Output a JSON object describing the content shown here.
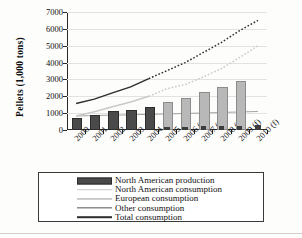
{
  "chart_data": {
    "type": "bar",
    "title": "",
    "xlabel": "",
    "ylabel": "Pellets (1,000 tons)",
    "ylim": [
      0,
      7000
    ],
    "yticks": [
      0,
      1000,
      2000,
      3000,
      4000,
      5000,
      6000,
      7000
    ],
    "ytick_labels": [
      "0",
      "1000",
      "2000",
      "3000",
      "4000",
      "5000",
      "6000",
      "7000"
    ],
    "grid": true,
    "legend_position": "below-plot",
    "categories": [
      "2000",
      "2001",
      "2002",
      "2003",
      "2004",
      "2005",
      "2006 (f)",
      "2007 (f)",
      "2008 (f)",
      "2009 (f)",
      "2010 (f)"
    ],
    "series": [
      {
        "name": "North American production",
        "kind": "bar",
        "color": "#4a4a4a",
        "values": [
          620,
          750,
          1000,
          1080,
          1270,
          1420,
          null,
          null,
          null,
          null,
          null
        ]
      },
      {
        "name": "North American consumption",
        "kind": "bar",
        "color": "#b8b8b8",
        "values": [
          null,
          null,
          null,
          null,
          null,
          1570,
          1760,
          2140,
          2460,
          2760,
          null
        ]
      },
      {
        "name": "European consumption",
        "kind": "line",
        "color": "#9a9a9a",
        "values": [
          830,
          860,
          880,
          900,
          930,
          950,
          980,
          1010,
          1040,
          1070,
          1100
        ]
      },
      {
        "name": "Other consumption",
        "kind": "bar",
        "color": "#3d3d3d",
        "values": [
          null,
          null,
          null,
          null,
          null,
          170,
          200,
          220,
          240,
          260,
          280
        ]
      },
      {
        "name": "Total consumption",
        "kind": "line",
        "color": "#2e2e2e",
        "solid_through": "2004",
        "values": [
          1570,
          1830,
          2200,
          2560,
          3050,
          3520,
          4000,
          4600,
          5200,
          5900,
          6500
        ]
      },
      {
        "name": "North American consumption (line)",
        "kind": "line",
        "color": "#c9c9c9",
        "solid_through": "2004",
        "values": [
          830,
          1080,
          1380,
          1660,
          2000,
          2450,
          2700,
          3150,
          3650,
          4300,
          5000
        ]
      }
    ]
  },
  "legend": {
    "items": [
      {
        "label": "North American production",
        "swatch": "prod"
      },
      {
        "label": "North American consumption",
        "swatch": "nacons"
      },
      {
        "label": "European consumption",
        "swatch": "eur"
      },
      {
        "label": "Other consumption",
        "swatch": "other"
      },
      {
        "label": "Total consumption",
        "swatch": "total"
      }
    ]
  }
}
